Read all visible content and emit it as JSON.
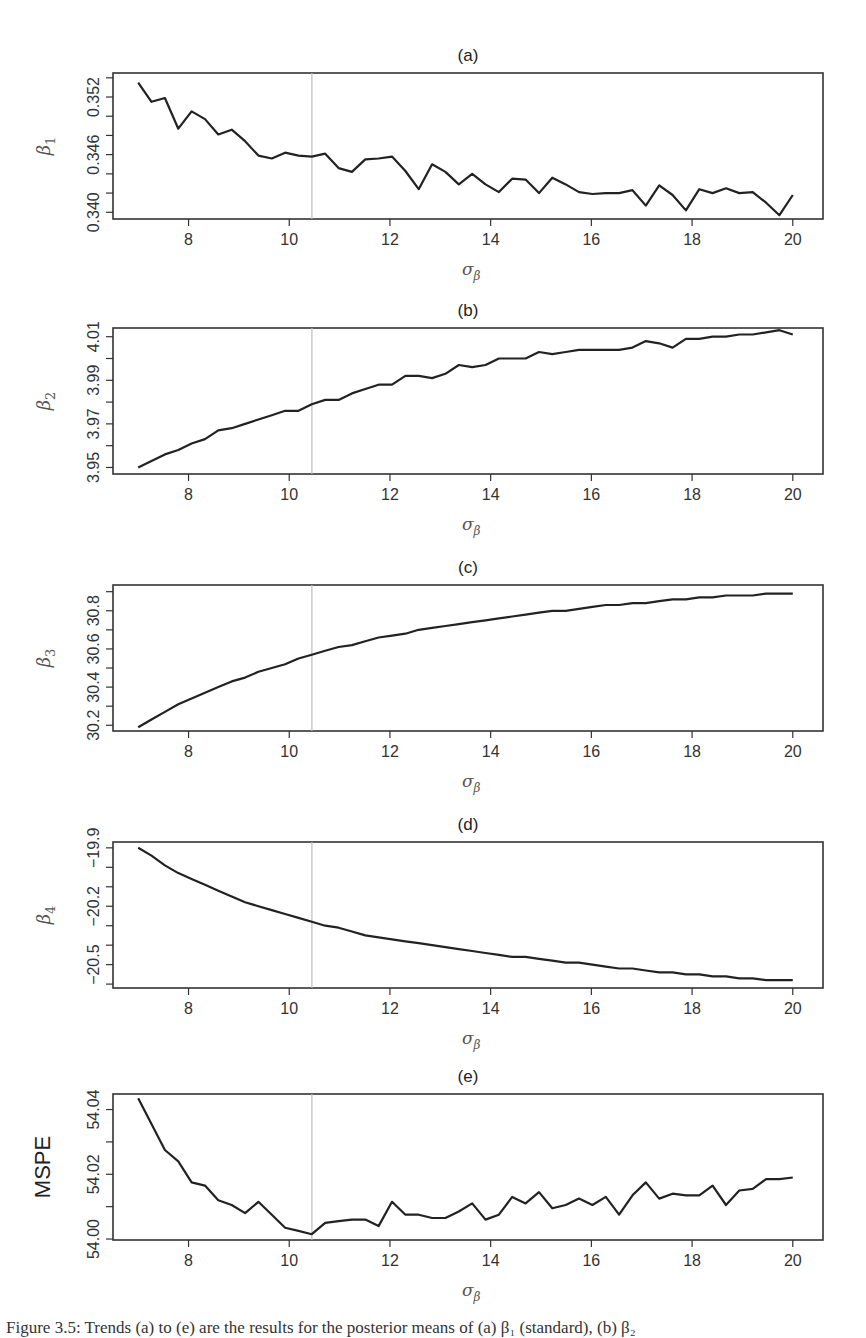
{
  "figure": {
    "caption": "Figure 3.5: Trends (a) to (e) are the results for the posterior means of (a) β₁ (standard), (b) β₂",
    "reference_line_x": 10.45,
    "x_tick_labels": [
      "8",
      "10",
      "12",
      "14",
      "16",
      "18",
      "20"
    ]
  },
  "chart_data": [
    {
      "type": "line",
      "panel": "(a)",
      "title": "(a)",
      "xlabel": "σ_β",
      "ylabel": "β₁",
      "xlim": [
        6.5,
        20.6
      ],
      "ylim": [
        0.3393,
        0.3545
      ],
      "x_ticks": [
        8,
        10,
        12,
        14,
        16,
        18,
        20
      ],
      "y_ticks": [
        0.34,
        0.342,
        0.344,
        0.346,
        0.348,
        0.35,
        0.352,
        0.354
      ],
      "y_tick_labels": {
        "0.340": "0.340",
        "0.346": "0.346",
        "0.352": "0.352"
      },
      "vline": 10.45,
      "grid": false,
      "x_start": 7,
      "x_end": 20,
      "values": [
        0.3535,
        0.3515,
        0.3519,
        0.3487,
        0.3505,
        0.3497,
        0.3481,
        0.3486,
        0.3474,
        0.3459,
        0.3456,
        0.3462,
        0.3459,
        0.3458,
        0.3461,
        0.3446,
        0.3442,
        0.3455,
        0.3456,
        0.3458,
        0.3443,
        0.3424,
        0.345,
        0.3442,
        0.3429,
        0.344,
        0.3429,
        0.3421,
        0.3435,
        0.3434,
        0.342,
        0.3436,
        0.3429,
        0.3421,
        0.3419,
        0.342,
        0.342,
        0.3423,
        0.3407,
        0.3428,
        0.3418,
        0.3402,
        0.3424,
        0.342,
        0.3425,
        0.342,
        0.3421,
        0.341,
        0.3397,
        0.3418
      ]
    },
    {
      "type": "line",
      "panel": "(b)",
      "title": "(b)",
      "xlabel": "σ_β",
      "ylabel": "β₂",
      "xlim": [
        6.5,
        20.6
      ],
      "ylim": [
        3.947,
        4.014
      ],
      "x_ticks": [
        8,
        10,
        12,
        14,
        16,
        18,
        20
      ],
      "y_ticks": [
        3.95,
        3.96,
        3.97,
        3.98,
        3.99,
        4.0,
        4.01
      ],
      "y_tick_labels": {
        "3.95": "3.95",
        "3.97": "3.97",
        "3.99": "3.99",
        "4.01": "4.01"
      },
      "vline": 10.45,
      "grid": false,
      "x_start": 7,
      "x_end": 20,
      "values": [
        3.95,
        3.953,
        3.956,
        3.958,
        3.961,
        3.963,
        3.967,
        3.968,
        3.97,
        3.972,
        3.974,
        3.976,
        3.976,
        3.979,
        3.981,
        3.981,
        3.984,
        3.986,
        3.988,
        3.988,
        3.992,
        3.992,
        3.991,
        3.993,
        3.997,
        3.996,
        3.997,
        4.0,
        4.0,
        4.0,
        4.003,
        4.002,
        4.003,
        4.004,
        4.004,
        4.004,
        4.004,
        4.005,
        4.008,
        4.007,
        4.005,
        4.009,
        4.009,
        4.01,
        4.01,
        4.011,
        4.011,
        4.012,
        4.013,
        4.011
      ]
    },
    {
      "type": "line",
      "panel": "(c)",
      "title": "(c)",
      "xlabel": "σ_β",
      "ylabel": "β₃",
      "xlim": [
        6.5,
        20.6
      ],
      "ylim": [
        30.17,
        30.935
      ],
      "x_ticks": [
        8,
        10,
        12,
        14,
        16,
        18,
        20
      ],
      "y_ticks": [
        30.2,
        30.3,
        30.4,
        30.5,
        30.6,
        30.7,
        30.8,
        30.9
      ],
      "y_tick_labels": {
        "30.2": "30.2",
        "30.4": "30.4",
        "30.6": "30.6",
        "30.8": "30.8"
      },
      "vline": 10.45,
      "grid": false,
      "x_start": 7,
      "x_end": 20,
      "values": [
        30.19,
        30.23,
        30.27,
        30.31,
        30.34,
        30.37,
        30.4,
        30.43,
        30.45,
        30.48,
        30.5,
        30.52,
        30.55,
        30.57,
        30.59,
        30.61,
        30.62,
        30.64,
        30.66,
        30.67,
        30.68,
        30.7,
        30.71,
        30.72,
        30.73,
        30.74,
        30.75,
        30.76,
        30.77,
        30.78,
        30.79,
        30.8,
        30.8,
        30.81,
        30.82,
        30.83,
        30.83,
        30.84,
        30.84,
        30.85,
        30.86,
        30.86,
        30.87,
        30.87,
        30.88,
        30.88,
        30.88,
        30.89,
        30.89,
        30.89
      ]
    },
    {
      "type": "line",
      "panel": "(d)",
      "title": "(d)",
      "xlabel": "σ_β",
      "ylabel": "β₄",
      "xlim": [
        6.5,
        20.6
      ],
      "ylim": [
        -20.62,
        -19.87
      ],
      "x_ticks": [
        8,
        10,
        12,
        14,
        16,
        18,
        20
      ],
      "y_ticks": [
        -19.9,
        -20.0,
        -20.1,
        -20.2,
        -20.3,
        -20.4,
        -20.5,
        -20.6
      ],
      "y_tick_labels": {
        "-19.9": "−19.9",
        "-20.2": "−20.2",
        "-20.5": "−20.5"
      },
      "vline": 10.45,
      "grid": false,
      "x_start": 7,
      "x_end": 20,
      "values": [
        -19.9,
        -19.94,
        -19.99,
        -20.03,
        -20.06,
        -20.09,
        -20.12,
        -20.15,
        -20.18,
        -20.2,
        -20.22,
        -20.24,
        -20.26,
        -20.28,
        -20.3,
        -20.31,
        -20.33,
        -20.35,
        -20.36,
        -20.37,
        -20.38,
        -20.39,
        -20.4,
        -20.41,
        -20.42,
        -20.43,
        -20.44,
        -20.45,
        -20.46,
        -20.46,
        -20.47,
        -20.48,
        -20.49,
        -20.49,
        -20.5,
        -20.51,
        -20.52,
        -20.52,
        -20.53,
        -20.54,
        -20.54,
        -20.55,
        -20.55,
        -20.56,
        -20.56,
        -20.57,
        -20.57,
        -20.58,
        -20.58,
        -20.58
      ]
    },
    {
      "type": "line",
      "panel": "(e)",
      "title": "(e)",
      "xlabel": "σ_β",
      "ylabel": "MSPE",
      "xlim": [
        6.5,
        20.6
      ],
      "ylim": [
        53.9997,
        54.0448
      ],
      "x_ticks": [
        8,
        10,
        12,
        14,
        16,
        18,
        20
      ],
      "y_ticks": [
        54.0,
        54.01,
        54.02,
        54.03,
        54.04
      ],
      "y_tick_labels": {
        "54.00": "54.00",
        "54.02": "54.02",
        "54.04": "54.04"
      },
      "vline": 10.45,
      "grid": false,
      "x_start": 7,
      "x_end": 20,
      "values": [
        54.0435,
        54.0355,
        54.0275,
        54.024,
        54.0175,
        54.0165,
        54.012,
        54.0105,
        54.008,
        54.0115,
        54.0075,
        54.0035,
        54.0025,
        54.0015,
        54.005,
        54.0055,
        54.006,
        54.006,
        54.004,
        54.0115,
        54.0075,
        54.0075,
        54.0065,
        54.0065,
        54.0085,
        54.011,
        54.006,
        54.0075,
        54.013,
        54.011,
        54.0145,
        54.0095,
        54.0105,
        54.0125,
        54.0105,
        54.013,
        54.0075,
        54.0135,
        54.0175,
        54.0125,
        54.014,
        54.0135,
        54.0135,
        54.0165,
        54.0105,
        54.015,
        54.0155,
        54.0185,
        54.0185,
        54.019
      ]
    }
  ]
}
